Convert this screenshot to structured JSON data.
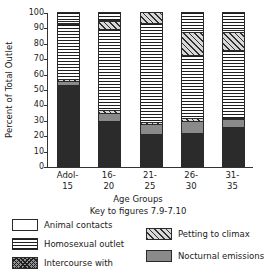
{
  "chart_data": {
    "type": "bar",
    "stacked": true,
    "title": "",
    "xlabel": "Age Groups",
    "ylabel": "Percent of Total Outlet",
    "ylim": [
      0,
      100
    ],
    "ytick_labels": [
      "100",
      "90",
      "80",
      "70",
      "60",
      "50",
      "40",
      "30",
      "20",
      "10",
      "0"
    ],
    "ytick_values": [
      100,
      90,
      80,
      70,
      60,
      50,
      40,
      30,
      20,
      10,
      0
    ],
    "grid": false,
    "categories": [
      "Adol-\n15",
      "16-\n20",
      "21-\n25",
      "26-\n30",
      "31-\n35"
    ],
    "category_lines": [
      [
        "Adol-",
        "15"
      ],
      [
        "16-",
        "20"
      ],
      [
        "21-",
        "25"
      ],
      [
        "26-",
        "30"
      ],
      [
        "31-",
        "35"
      ]
    ],
    "series": [
      {
        "name": "Intercourse with",
        "key": "intercourse",
        "pattern": "checker-dark-solid",
        "color": "#2b2b2b",
        "values": [
          52,
          29,
          20,
          21,
          25
        ]
      },
      {
        "name": "Nocturnal emissions",
        "key": "nocturnal",
        "pattern": "solid-gray",
        "color": "#8a8a8a",
        "values": [
          3,
          5,
          7,
          8,
          5
        ]
      },
      {
        "name": "Petting to climax",
        "key": "petting",
        "pattern": "diagonal-hatch",
        "color": "#d8d8d8",
        "values": [
          1,
          2,
          1,
          2,
          1
        ]
      },
      {
        "name": "Homosexual outlet",
        "key": "homosexual",
        "pattern": "horizontal-lines",
        "color": "#ffffff",
        "values": [
          36,
          53,
          65,
          41,
          44
        ]
      },
      {
        "name": "Petting to climax 2",
        "key": "petting2",
        "pattern": "diagonal-hatch",
        "color": "#d8d8d8",
        "values": [
          1,
          5,
          7,
          15,
          12
        ]
      },
      {
        "name": "Animal contacts",
        "key": "animal",
        "pattern": "white",
        "color": "#ffffff",
        "values": [
          1,
          1,
          0,
          1,
          1
        ]
      },
      {
        "name": "Homosexual outlet 2",
        "key": "homosexual2",
        "pattern": "horizontal-lines",
        "color": "#ffffff",
        "values": [
          6,
          5,
          0,
          12,
          12
        ]
      }
    ],
    "legend": {
      "title": "Key to figures 7.9-7.10",
      "position": "below",
      "entries": [
        {
          "label": "Animal contacts",
          "pattern": "white",
          "swatch": "pat-white"
        },
        {
          "label": "Homosexual outlet",
          "pattern": "horizontal-lines",
          "swatch": "pat-hlines"
        },
        {
          "label": "Intercourse with",
          "pattern": "checker",
          "swatch": "pat-check"
        },
        {
          "label": "Petting to climax",
          "pattern": "diagonal-hatch",
          "swatch": "pat-diag"
        },
        {
          "label": "Nocturnal emissions",
          "pattern": "solid-gray",
          "swatch": "pat-gray"
        }
      ]
    }
  }
}
